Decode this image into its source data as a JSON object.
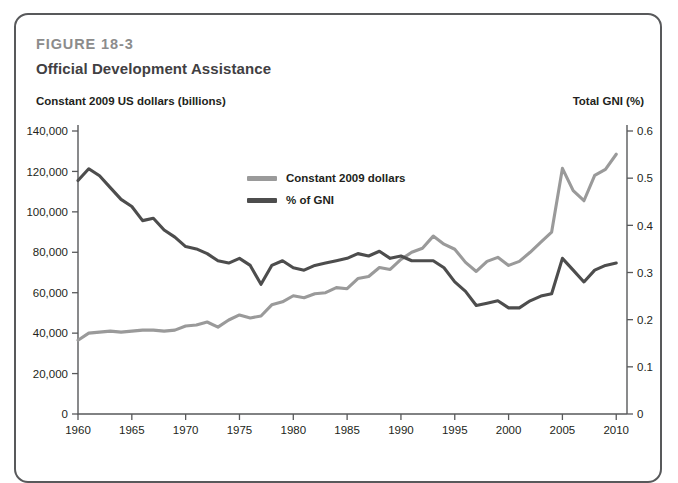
{
  "figure": {
    "label": "FIGURE 18-3",
    "title": "Official Development Assistance",
    "left_axis_title": "Constant 2009 US dollars (billions)",
    "right_axis_title": "Total GNI (%)"
  },
  "colors": {
    "constant_dollars": "#9a9a9a",
    "pct_gni": "#4d4d4d",
    "axis": "#58595b",
    "border": "#58595b",
    "figure_label": "#8c8c8c",
    "title": "#414042"
  },
  "legend": {
    "position": "inside-top-center",
    "items": [
      {
        "label": "Constant 2009 dollars",
        "color": "#9a9a9a"
      },
      {
        "label": "% of GNI",
        "color": "#4d4d4d"
      }
    ]
  },
  "chart_data": {
    "type": "line",
    "title": "Official Development Assistance",
    "subtitle": "FIGURE 18-3",
    "xlabel": "",
    "ylabel": "Constant 2009 US dollars (billions)",
    "y2label": "Total GNI (%)",
    "xlim": [
      1960,
      2011
    ],
    "ylim": [
      0,
      140000
    ],
    "y2lim": [
      0,
      0.6
    ],
    "grid": false,
    "xticks": [
      1960,
      1965,
      1970,
      1975,
      1980,
      1985,
      1990,
      1995,
      2000,
      2005,
      2010
    ],
    "xticklabels": [
      "1960",
      "1965",
      "1970",
      "1975",
      "1980",
      "1985",
      "1990",
      "1995",
      "2000",
      "2005",
      "2010"
    ],
    "yticks": [
      0,
      20000,
      40000,
      60000,
      80000,
      100000,
      120000,
      140000
    ],
    "yticklabels": [
      "0",
      "20,000",
      "40,000",
      "60,000",
      "80,000",
      "100,000",
      "120,000",
      "140,000"
    ],
    "y2ticks": [
      0,
      0.1,
      0.2,
      0.3,
      0.4,
      0.5,
      0.6
    ],
    "y2ticklabels": [
      "0",
      "0.1",
      "0.2",
      "0.3",
      "0.4",
      "0.5",
      "0.6"
    ],
    "x": [
      1960,
      1961,
      1962,
      1963,
      1964,
      1965,
      1966,
      1967,
      1968,
      1969,
      1970,
      1971,
      1972,
      1973,
      1974,
      1975,
      1976,
      1977,
      1978,
      1979,
      1980,
      1981,
      1982,
      1983,
      1984,
      1985,
      1986,
      1987,
      1988,
      1989,
      1990,
      1991,
      1992,
      1993,
      1994,
      1995,
      1996,
      1997,
      1998,
      1999,
      2000,
      2001,
      2002,
      2003,
      2004,
      2005,
      2006,
      2007,
      2008,
      2009,
      2010
    ],
    "series": [
      {
        "name": "Constant 2009 dollars",
        "axis": "left",
        "color": "#9a9a9a",
        "unit": "millions of constant 2009 US dollars",
        "values": [
          36500,
          40000,
          40500,
          41000,
          40500,
          41000,
          41500,
          41500,
          41000,
          41500,
          43500,
          44000,
          45500,
          43000,
          46500,
          49000,
          47500,
          48500,
          54000,
          55500,
          58500,
          57500,
          59500,
          60000,
          62500,
          62000,
          67000,
          68000,
          72500,
          71500,
          76500,
          80000,
          82000,
          88000,
          84000,
          81500,
          75000,
          70500,
          75500,
          77500,
          73500,
          75500,
          80000,
          85000,
          90000,
          121500,
          110500,
          105500,
          118000,
          121000,
          128500
        ]
      },
      {
        "name": "% of GNI",
        "axis": "right",
        "color": "#4d4d4d",
        "unit": "percent of total gross national income",
        "values": [
          0.495,
          0.52,
          0.505,
          0.48,
          0.455,
          0.44,
          0.41,
          0.415,
          0.39,
          0.375,
          0.355,
          0.35,
          0.34,
          0.325,
          0.32,
          0.33,
          0.315,
          0.275,
          0.315,
          0.325,
          0.31,
          0.305,
          0.315,
          0.32,
          0.325,
          0.33,
          0.34,
          0.335,
          0.345,
          0.33,
          0.335,
          0.325,
          0.325,
          0.325,
          0.31,
          0.28,
          0.26,
          0.23,
          0.235,
          0.24,
          0.225,
          0.225,
          0.24,
          0.25,
          0.255,
          0.33,
          0.305,
          0.28,
          0.305,
          0.315,
          0.32
        ]
      }
    ]
  }
}
